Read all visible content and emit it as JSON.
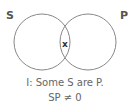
{
  "diagram": {
    "type": "venn",
    "sets": [
      {
        "label": "S",
        "cx": 42,
        "cy": 42,
        "r": 28
      },
      {
        "label": "P",
        "cx": 88,
        "cy": 42,
        "r": 28
      }
    ],
    "intersection_mark": "x",
    "stroke_color": "#888888",
    "caption_line1": "I: Some S are P.",
    "caption_line2": "SP ≠ 0"
  }
}
